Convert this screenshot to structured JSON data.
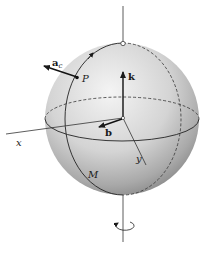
{
  "diagram": {
    "type": "rotating-sphere-vector-diagram",
    "labels": {
      "z_axis": "z",
      "x_axis": "x",
      "y_axis": "y",
      "unit_vector_k": "k",
      "vector_b": "b",
      "point_p": "P",
      "accel_main": "a",
      "accel_subscript": "c",
      "body_label": "M"
    },
    "colors": {
      "sphere_light": "#f2f2f2",
      "sphere_mid": "#cfcfcf",
      "sphere_dark": "#8e8e8e",
      "line": "#222222",
      "background": "#ffffff"
    },
    "elements": [
      "sphere",
      "equator-front-solid",
      "equator-back-dashed",
      "meridian-front-solid",
      "meridian-back-dashed",
      "z-axis",
      "x-axis",
      "y-axis",
      "k-vector",
      "b-vector",
      "ac-vector",
      "point-P",
      "north-pole-marker",
      "rotation-arrow"
    ]
  }
}
